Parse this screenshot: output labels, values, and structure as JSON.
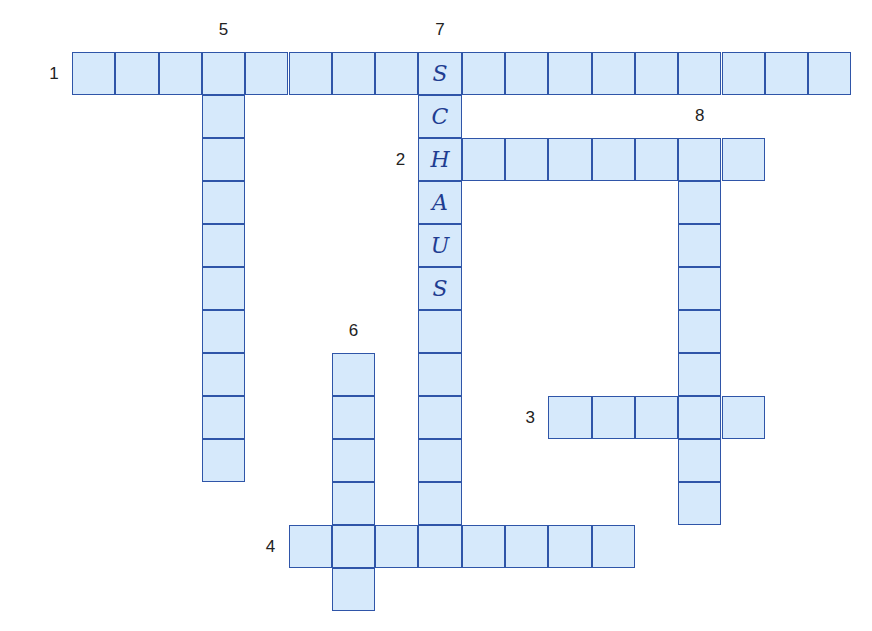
{
  "puzzle": {
    "type": "crossword",
    "grid_origin": {
      "x": 72,
      "y": 52
    },
    "cell_size": {
      "w": 43.3,
      "h": 43
    },
    "colors": {
      "cell_fill": "#d6e9fb",
      "cell_border": "#2f55a8",
      "letter": "#1f3d91",
      "number": "#222222"
    },
    "words": [
      {
        "number": "1",
        "direction": "across",
        "row": 0,
        "col": 0,
        "length": 18,
        "letters": [
          "",
          "",
          "",
          "",
          "",
          "",
          "",
          "",
          "S",
          "",
          "",
          "",
          "",
          "",
          "",
          "",
          "",
          ""
        ]
      },
      {
        "number": "2",
        "direction": "across",
        "row": 2,
        "col": 8,
        "length": 8,
        "letters": [
          "H",
          "",
          "",
          "",
          "",
          "",
          "",
          ""
        ]
      },
      {
        "number": "3",
        "direction": "across",
        "row": 8,
        "col": 11,
        "length": 5,
        "letters": [
          "",
          "",
          "",
          "",
          ""
        ]
      },
      {
        "number": "4",
        "direction": "across",
        "row": 11,
        "col": 5,
        "length": 8,
        "letters": [
          "",
          "",
          "",
          "",
          "",
          "",
          "",
          ""
        ]
      },
      {
        "number": "5",
        "direction": "down",
        "row": 0,
        "col": 3,
        "length": 10,
        "letters": [
          "",
          "",
          "",
          "",
          "",
          "",
          "",
          "",
          "",
          ""
        ]
      },
      {
        "number": "6",
        "direction": "down",
        "row": 7,
        "col": 6,
        "length": 6,
        "letters": [
          "",
          "",
          "",
          "",
          "",
          ""
        ]
      },
      {
        "number": "7",
        "direction": "down",
        "row": 0,
        "col": 8,
        "length": 11,
        "letters": [
          "S",
          "C",
          "H",
          "A",
          "U",
          "S",
          "",
          "",
          "",
          "",
          ""
        ]
      },
      {
        "number": "8",
        "direction": "down",
        "row": 2,
        "col": 14,
        "length": 9,
        "letters": [
          "",
          "",
          "",
          "",
          "",
          "",
          "",
          "",
          ""
        ]
      }
    ]
  }
}
